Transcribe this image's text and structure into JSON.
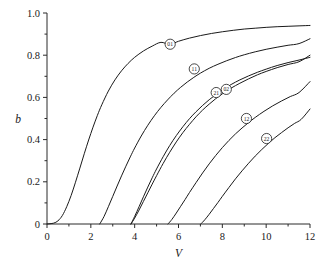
{
  "chart_data": {
    "type": "line",
    "title": "",
    "subtitle": "",
    "xlabel": "V",
    "ylabel": "b",
    "xlim": [
      0,
      12
    ],
    "ylim": [
      0,
      1.0
    ],
    "grid": false,
    "legend": "inline-badges-on-curves",
    "x_ticks_major": [
      0,
      2,
      4,
      6,
      8,
      10,
      12
    ],
    "x_tick_labels": [
      "0",
      "2",
      "4",
      "6",
      "8",
      "10",
      "12"
    ],
    "x_ticks_minor": [
      1,
      3,
      5,
      7,
      9,
      11
    ],
    "y_ticks_major": [
      0,
      0.2,
      0.4,
      0.6,
      0.8,
      1.0
    ],
    "y_tick_labels": [
      "0",
      "0.2",
      "0.4",
      "0.6",
      "0.8",
      "1.0"
    ],
    "y_ticks_minor": [
      0.1,
      0.3,
      0.5,
      0.7,
      0.9
    ],
    "series": [
      {
        "name": "01",
        "label": "01",
        "cutoff_V": 0.0,
        "label_at": {
          "x": 5.62,
          "y": 0.852
        },
        "points": [
          [
            0.0,
            0.0
          ],
          [
            0.3,
            0.004
          ],
          [
            0.5,
            0.015
          ],
          [
            0.7,
            0.04
          ],
          [
            0.9,
            0.082
          ],
          [
            1.1,
            0.135
          ],
          [
            1.3,
            0.198
          ],
          [
            1.5,
            0.265
          ],
          [
            1.7,
            0.333
          ],
          [
            1.9,
            0.398
          ],
          [
            2.1,
            0.459
          ],
          [
            2.3,
            0.515
          ],
          [
            2.5,
            0.565
          ],
          [
            2.8,
            0.63
          ],
          [
            3.1,
            0.683
          ],
          [
            3.4,
            0.726
          ],
          [
            3.7,
            0.761
          ],
          [
            4.0,
            0.79
          ],
          [
            4.4,
            0.82
          ],
          [
            4.8,
            0.843
          ],
          [
            5.2,
            0.861
          ],
          [
            5.6,
            0.851
          ],
          [
            6.0,
            0.866
          ],
          [
            6.5,
            0.881
          ],
          [
            7.0,
            0.893
          ],
          [
            7.5,
            0.903
          ],
          [
            8.0,
            0.911
          ],
          [
            8.5,
            0.918
          ],
          [
            9.0,
            0.924
          ],
          [
            9.5,
            0.928
          ],
          [
            10.0,
            0.932
          ],
          [
            10.5,
            0.935
          ],
          [
            11.0,
            0.937
          ],
          [
            11.5,
            0.939
          ],
          [
            12.0,
            0.941
          ]
        ]
      },
      {
        "name": "11",
        "label": "11",
        "cutoff_V": 2.405,
        "label_at": {
          "x": 6.72,
          "y": 0.735
        },
        "points": [
          [
            2.405,
            0.0
          ],
          [
            2.6,
            0.035
          ],
          [
            2.8,
            0.082
          ],
          [
            3.0,
            0.131
          ],
          [
            3.2,
            0.18
          ],
          [
            3.4,
            0.228
          ],
          [
            3.6,
            0.274
          ],
          [
            3.8,
            0.318
          ],
          [
            4.0,
            0.36
          ],
          [
            4.3,
            0.417
          ],
          [
            4.6,
            0.468
          ],
          [
            4.9,
            0.513
          ],
          [
            5.2,
            0.553
          ],
          [
            5.5,
            0.588
          ],
          [
            5.8,
            0.62
          ],
          [
            6.1,
            0.648
          ],
          [
            6.4,
            0.673
          ],
          [
            6.7,
            0.695
          ],
          [
            7.0,
            0.715
          ],
          [
            7.4,
            0.738
          ],
          [
            7.8,
            0.757
          ],
          [
            8.2,
            0.774
          ],
          [
            8.6,
            0.789
          ],
          [
            9.0,
            0.802
          ],
          [
            9.5,
            0.816
          ],
          [
            10.0,
            0.828
          ],
          [
            10.5,
            0.838
          ],
          [
            11.0,
            0.847
          ],
          [
            11.5,
            0.855
          ],
          [
            12.0,
            0.878
          ]
        ]
      },
      {
        "name": "21",
        "label": "21",
        "cutoff_V": 3.832,
        "label_at": {
          "x": 7.72,
          "y": 0.623
        },
        "points": [
          [
            3.832,
            0.0
          ],
          [
            4.0,
            0.028
          ],
          [
            4.2,
            0.066
          ],
          [
            4.4,
            0.107
          ],
          [
            4.6,
            0.148
          ],
          [
            4.8,
            0.189
          ],
          [
            5.0,
            0.229
          ],
          [
            5.3,
            0.287
          ],
          [
            5.6,
            0.34
          ],
          [
            5.9,
            0.389
          ],
          [
            6.2,
            0.433
          ],
          [
            6.5,
            0.472
          ],
          [
            6.8,
            0.508
          ],
          [
            7.1,
            0.54
          ],
          [
            7.4,
            0.568
          ],
          [
            7.7,
            0.594
          ],
          [
            8.0,
            0.617
          ],
          [
            8.4,
            0.644
          ],
          [
            8.8,
            0.667
          ],
          [
            9.2,
            0.688
          ],
          [
            9.6,
            0.707
          ],
          [
            10.0,
            0.723
          ],
          [
            10.5,
            0.741
          ],
          [
            11.0,
            0.756
          ],
          [
            11.5,
            0.769
          ],
          [
            12.0,
            0.8
          ]
        ]
      },
      {
        "name": "02",
        "label": "02",
        "cutoff_V": 3.832,
        "label_at": {
          "x": 8.18,
          "y": 0.638
        },
        "points": [
          [
            3.832,
            0.0
          ],
          [
            4.0,
            0.036
          ],
          [
            4.2,
            0.082
          ],
          [
            4.4,
            0.129
          ],
          [
            4.6,
            0.175
          ],
          [
            4.8,
            0.219
          ],
          [
            5.0,
            0.261
          ],
          [
            5.3,
            0.319
          ],
          [
            5.6,
            0.372
          ],
          [
            5.9,
            0.419
          ],
          [
            6.2,
            0.461
          ],
          [
            6.5,
            0.499
          ],
          [
            6.8,
            0.532
          ],
          [
            7.1,
            0.562
          ],
          [
            7.4,
            0.589
          ],
          [
            7.7,
            0.613
          ],
          [
            8.0,
            0.635
          ],
          [
            8.4,
            0.661
          ],
          [
            8.8,
            0.683
          ],
          [
            9.2,
            0.702
          ],
          [
            9.6,
            0.719
          ],
          [
            10.0,
            0.734
          ],
          [
            10.5,
            0.751
          ],
          [
            11.0,
            0.765
          ],
          [
            11.5,
            0.777
          ],
          [
            12.0,
            0.79
          ]
        ]
      },
      {
        "name": "12",
        "label": "12",
        "cutoff_V": 5.52,
        "label_at": {
          "x": 9.1,
          "y": 0.5
        },
        "points": [
          [
            5.52,
            0.0
          ],
          [
            5.7,
            0.022
          ],
          [
            5.9,
            0.052
          ],
          [
            6.1,
            0.084
          ],
          [
            6.3,
            0.116
          ],
          [
            6.5,
            0.149
          ],
          [
            6.8,
            0.196
          ],
          [
            7.1,
            0.242
          ],
          [
            7.4,
            0.285
          ],
          [
            7.7,
            0.325
          ],
          [
            8.0,
            0.362
          ],
          [
            8.3,
            0.396
          ],
          [
            8.6,
            0.427
          ],
          [
            8.9,
            0.455
          ],
          [
            9.2,
            0.481
          ],
          [
            9.5,
            0.505
          ],
          [
            9.9,
            0.534
          ],
          [
            10.3,
            0.56
          ],
          [
            10.7,
            0.583
          ],
          [
            11.1,
            0.604
          ],
          [
            11.5,
            0.623
          ],
          [
            12.0,
            0.675
          ]
        ]
      },
      {
        "name": "22",
        "label": "22",
        "cutoff_V": 7.016,
        "label_at": {
          "x": 10.02,
          "y": 0.405
        },
        "points": [
          [
            7.016,
            0.0
          ],
          [
            7.2,
            0.02
          ],
          [
            7.4,
            0.046
          ],
          [
            7.6,
            0.074
          ],
          [
            7.8,
            0.102
          ],
          [
            8.0,
            0.131
          ],
          [
            8.3,
            0.173
          ],
          [
            8.6,
            0.214
          ],
          [
            8.9,
            0.252
          ],
          [
            9.2,
            0.288
          ],
          [
            9.5,
            0.322
          ],
          [
            9.8,
            0.353
          ],
          [
            10.1,
            0.382
          ],
          [
            10.4,
            0.409
          ],
          [
            10.7,
            0.433
          ],
          [
            11.0,
            0.456
          ],
          [
            11.3,
            0.477
          ],
          [
            11.6,
            0.496
          ],
          [
            12.0,
            0.545
          ]
        ]
      }
    ]
  }
}
